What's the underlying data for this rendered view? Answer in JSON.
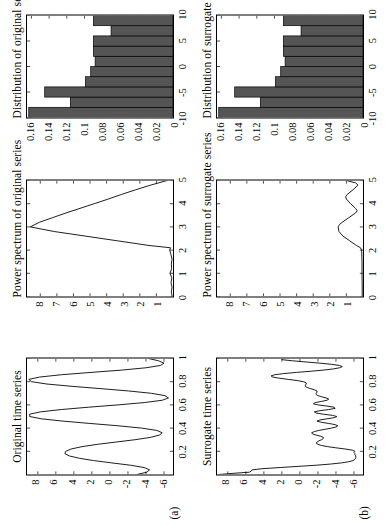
{
  "figure": {
    "row_labels": [
      "(a)",
      "(b)"
    ],
    "rows": [
      {
        "key": "original",
        "label": "(a)",
        "panels": [
          {
            "name": "original-time-series",
            "title": "Original time series",
            "xticks": [
              "0.2",
              "0.4",
              "0.6",
              "0.8",
              "1"
            ],
            "yticks": [
              "8",
              "6",
              "4",
              "2",
              "0",
              "-2",
              "-4",
              "-6"
            ]
          },
          {
            "name": "original-power-spectrum",
            "title": "Power spectrum of original series",
            "xticks": [
              "0",
              "1",
              "2",
              "3",
              "4",
              "5"
            ],
            "yticks": [
              "8",
              "7",
              "6",
              "5",
              "4",
              "3",
              "2",
              "1"
            ]
          },
          {
            "name": "original-distribution",
            "title": "Distribution of original series",
            "xticks": [
              "-10",
              "-5",
              "0",
              "5",
              "10"
            ],
            "yticks": [
              "0.16",
              "0.14",
              "0.12",
              "0.1",
              "0.08",
              "0.06",
              "0.04",
              "0.02",
              "0"
            ]
          }
        ]
      },
      {
        "key": "surrogate",
        "label": "(b)",
        "panels": [
          {
            "name": "surrogate-time-series",
            "title": "Surrogate time series",
            "xticks": [
              "0.2",
              "0.4",
              "0.6",
              "0.8",
              "1"
            ],
            "yticks": [
              "8",
              "6",
              "4",
              "2",
              "0",
              "-2",
              "-4",
              "-6"
            ]
          },
          {
            "name": "surrogate-power-spectrum",
            "title": "Power spectrum of surrogate series",
            "xticks": [
              "0",
              "1",
              "2",
              "3",
              "4",
              "5"
            ],
            "yticks": [
              "8",
              "7",
              "6",
              "5",
              "4",
              "3",
              "2",
              "1"
            ]
          },
          {
            "name": "surrogate-distribution",
            "title": "Distribution of surrogate series",
            "xticks": [
              "-10",
              "-5",
              "0",
              "5",
              "10"
            ],
            "yticks": [
              "0.16",
              "0.14",
              "0.12",
              "0.1",
              "0.08",
              "0.06",
              "0.04",
              "0.02",
              "0"
            ]
          }
        ]
      }
    ]
  },
  "chart_data": [
    {
      "type": "line",
      "name": "original-time-series",
      "title": "Original time series",
      "xlabel": "",
      "ylabel": "",
      "xlim": [
        0,
        1
      ],
      "ylim": [
        -7,
        9.2
      ],
      "xticks": [
        0.2,
        0.4,
        0.6,
        0.8,
        1
      ],
      "yticks": [
        8,
        6,
        4,
        2,
        0,
        -2,
        -4,
        -6
      ],
      "grid": false,
      "description": "Smooth quasi-periodic oscillation, roughly 3.5 cycles over t=0..1, amplitude about -6 to +9",
      "x": [
        0.0,
        0.02,
        0.04,
        0.06,
        0.08,
        0.1,
        0.12,
        0.14,
        0.16,
        0.18,
        0.2,
        0.22,
        0.24,
        0.26,
        0.28,
        0.3,
        0.32,
        0.34,
        0.36,
        0.38,
        0.4,
        0.42,
        0.44,
        0.46,
        0.48,
        0.5,
        0.52,
        0.54,
        0.56,
        0.58,
        0.6,
        0.62,
        0.64,
        0.66,
        0.68,
        0.7,
        0.72,
        0.74,
        0.76,
        0.78,
        0.8,
        0.82,
        0.84,
        0.86,
        0.88,
        0.9,
        0.92,
        0.94,
        0.96,
        0.98,
        1.0
      ],
      "y": [
        -3.0,
        -4.1,
        -4.4,
        -3.8,
        -2.3,
        -0.2,
        1.8,
        3.4,
        4.5,
        5.0,
        4.9,
        4.3,
        3.1,
        1.4,
        -0.7,
        -2.8,
        -4.5,
        -5.5,
        -5.8,
        -5.2,
        -3.5,
        -0.9,
        2.2,
        5.2,
        7.6,
        8.9,
        8.9,
        7.7,
        5.4,
        2.4,
        -0.9,
        -3.8,
        -5.8,
        -6.5,
        -6.1,
        -4.6,
        -2.1,
        1.0,
        4.2,
        7.0,
        8.7,
        9.0,
        7.8,
        5.4,
        2.1,
        -1.3,
        -4.0,
        -5.6,
        -6.0,
        -5.4,
        -4.3
      ]
    },
    {
      "type": "line",
      "name": "original-power-spectrum",
      "title": "Power spectrum of original series",
      "xlabel": "",
      "ylabel": "",
      "xlim": [
        0,
        5
      ],
      "ylim": [
        0,
        8.8
      ],
      "xticks": [
        0,
        1,
        2,
        3,
        4,
        5
      ],
      "yticks": [
        8,
        7,
        6,
        5,
        4,
        3,
        2,
        1
      ],
      "grid": false,
      "description": "Near-zero up to f=2, then a single sharp triangular peak reaching ~8.6 at f=3, decaying linearly back to 0 at f=5",
      "x": [
        0.0,
        0.2,
        0.4,
        0.6,
        0.8,
        1.0,
        1.2,
        1.4,
        1.6,
        1.8,
        2.0,
        2.1,
        2.2,
        2.4,
        2.6,
        2.8,
        3.0,
        3.2,
        3.4,
        3.6,
        3.8,
        4.0,
        4.2,
        4.4,
        4.6,
        4.8,
        5.0
      ],
      "y": [
        0.05,
        0.1,
        0.06,
        0.12,
        0.07,
        0.18,
        0.08,
        0.1,
        0.06,
        0.12,
        0.2,
        0.15,
        1.45,
        3.35,
        5.25,
        7.15,
        8.6,
        8.05,
        7.25,
        6.45,
        5.6,
        4.75,
        3.9,
        3.1,
        2.25,
        1.35,
        0.35
      ]
    },
    {
      "type": "bar",
      "name": "original-distribution",
      "title": "Distribution of original series",
      "xlabel": "",
      "ylabel": "",
      "xlim": [
        -10,
        10
      ],
      "ylim": [
        0,
        0.165
      ],
      "xticks": [
        -10,
        -5,
        0,
        5,
        10
      ],
      "yticks": [
        0.16,
        0.14,
        0.12,
        0.1,
        0.08,
        0.06,
        0.04,
        0.02,
        0
      ],
      "grid": false,
      "description": "Bimodal U-shaped histogram typical of a sinusoid, 10 bins over -10..10",
      "bin_edges": [
        -10,
        -8,
        -6,
        -4,
        -2,
        0,
        2,
        4,
        6,
        8,
        10
      ],
      "bin_centers": [
        -9,
        -7,
        -5,
        -3,
        -1,
        1,
        3,
        5,
        7,
        9
      ],
      "values": [
        0.163,
        0.116,
        0.145,
        0.099,
        0.093,
        0.088,
        0.09,
        0.09,
        0.07,
        0.09
      ]
    },
    {
      "type": "line",
      "name": "surrogate-time-series",
      "title": "Surrogate time series",
      "xlabel": "",
      "ylabel": "",
      "xlim": [
        0,
        1
      ],
      "ylim": [
        -7,
        9.2
      ],
      "xticks": [
        0.2,
        0.4,
        0.6,
        0.8,
        1
      ],
      "yticks": [
        8,
        6,
        4,
        2,
        0,
        -2,
        -4,
        -6
      ],
      "grid": false,
      "description": "Irregular noisy series with same amplitude distribution as the original but randomized phases; long flat stretch near -6 around t=0.15-0.2 and a burst of high-frequency wiggles for t=0.4-0.65",
      "x": [
        0.0,
        0.01,
        0.02,
        0.03,
        0.04,
        0.05,
        0.06,
        0.07,
        0.08,
        0.09,
        0.1,
        0.11,
        0.12,
        0.13,
        0.14,
        0.15,
        0.16,
        0.17,
        0.18,
        0.19,
        0.2,
        0.21,
        0.22,
        0.23,
        0.24,
        0.25,
        0.26,
        0.27,
        0.28,
        0.29,
        0.3,
        0.31,
        0.32,
        0.33,
        0.34,
        0.35,
        0.36,
        0.37,
        0.38,
        0.39,
        0.4,
        0.41,
        0.42,
        0.43,
        0.44,
        0.45,
        0.46,
        0.47,
        0.48,
        0.49,
        0.5,
        0.51,
        0.52,
        0.53,
        0.54,
        0.55,
        0.56,
        0.57,
        0.58,
        0.59,
        0.6,
        0.61,
        0.62,
        0.63,
        0.64,
        0.65,
        0.66,
        0.67,
        0.68,
        0.69,
        0.7,
        0.71,
        0.72,
        0.73,
        0.74,
        0.75,
        0.76,
        0.77,
        0.78,
        0.79,
        0.8,
        0.81,
        0.82,
        0.83,
        0.84,
        0.85,
        0.86,
        0.87,
        0.88,
        0.89,
        0.9,
        0.91,
        0.92,
        0.93,
        0.94,
        0.95,
        0.96,
        0.97,
        0.98,
        0.99,
        1.0
      ],
      "y": [
        9.0,
        7.4,
        5.6,
        5.4,
        5.3,
        4.2,
        2.2,
        0.2,
        -1.8,
        -3.4,
        -4.6,
        -5.4,
        -5.9,
        -6.1,
        -6.2,
        -6.2,
        -6.2,
        -6.1,
        -6.1,
        -6.0,
        -6.1,
        -5.8,
        -5.0,
        -4.0,
        -3.1,
        -2.4,
        -2.0,
        -1.8,
        -1.9,
        -2.1,
        -2.4,
        -2.6,
        -2.6,
        -2.3,
        -1.8,
        -1.4,
        -1.3,
        -1.6,
        -2.1,
        -2.8,
        -3.5,
        -4.0,
        -4.2,
        -3.9,
        -3.2,
        -2.4,
        -1.9,
        -2.2,
        -3.0,
        -3.8,
        -4.1,
        -3.6,
        -2.6,
        -1.8,
        -1.6,
        -2.2,
        -3.2,
        -3.9,
        -3.8,
        -3.0,
        -2.0,
        -1.5,
        -1.7,
        -2.4,
        -3.0,
        -3.2,
        -2.9,
        -2.4,
        -2.0,
        -1.8,
        -1.8,
        -1.9,
        -1.9,
        -1.6,
        -1.2,
        -0.8,
        -0.6,
        -0.6,
        -0.7,
        -0.7,
        -0.4,
        0.3,
        1.3,
        2.3,
        3.0,
        3.2,
        2.8,
        1.8,
        0.4,
        -1.2,
        -2.6,
        -3.7,
        -4.4,
        -4.7,
        -4.4,
        -3.5,
        -2.2,
        -0.7,
        0.8,
        2.0
      ]
    },
    {
      "type": "line",
      "name": "surrogate-power-spectrum",
      "title": "Power spectrum of surrogate series",
      "xlabel": "",
      "ylabel": "",
      "xlim": [
        0,
        5
      ],
      "ylim": [
        0,
        8.8
      ],
      "xticks": [
        0,
        1,
        2,
        3,
        4,
        5
      ],
      "yticks": [
        8,
        7,
        6,
        5,
        4,
        3,
        2,
        1
      ],
      "grid": false,
      "description": "Flat near zero until f=2, then two low broad humps peaking near 1.5 at f=3 and near 1.0 at f=4.3, small rise at f=5",
      "x": [
        0.0,
        0.5,
        1.0,
        1.5,
        2.0,
        2.1,
        2.2,
        2.4,
        2.6,
        2.8,
        3.0,
        3.1,
        3.2,
        3.4,
        3.6,
        3.7,
        3.8,
        4.0,
        4.2,
        4.3,
        4.4,
        4.6,
        4.8,
        4.9,
        5.0
      ],
      "y": [
        0.05,
        0.05,
        0.06,
        0.06,
        0.08,
        0.15,
        0.4,
        0.8,
        1.2,
        1.45,
        1.5,
        1.42,
        1.25,
        0.85,
        0.45,
        0.35,
        0.45,
        0.75,
        1.0,
        1.05,
        0.95,
        0.6,
        0.3,
        0.45,
        1.0
      ]
    },
    {
      "type": "bar",
      "name": "surrogate-distribution",
      "title": "Distribution of surrogate series",
      "xlabel": "",
      "ylabel": "",
      "xlim": [
        -10,
        10
      ],
      "ylim": [
        0,
        0.165
      ],
      "xticks": [
        -10,
        -5,
        0,
        5,
        10
      ],
      "yticks": [
        0.16,
        0.14,
        0.12,
        0.1,
        0.08,
        0.06,
        0.04,
        0.02,
        0
      ],
      "grid": false,
      "description": "Identical bin heights to the original distribution, confirming the surrogate preserves the amplitude distribution",
      "bin_edges": [
        -10,
        -8,
        -6,
        -4,
        -2,
        0,
        2,
        4,
        6,
        8,
        10
      ],
      "bin_centers": [
        -9,
        -7,
        -5,
        -3,
        -1,
        1,
        3,
        5,
        7,
        9
      ],
      "values": [
        0.163,
        0.116,
        0.145,
        0.099,
        0.093,
        0.088,
        0.09,
        0.09,
        0.07,
        0.09
      ]
    }
  ],
  "style": {
    "bar_fill": "#555555",
    "bar_stroke": "#000000",
    "line_color": "#000000",
    "axis_color": "#000000",
    "background": "#ffffff"
  }
}
